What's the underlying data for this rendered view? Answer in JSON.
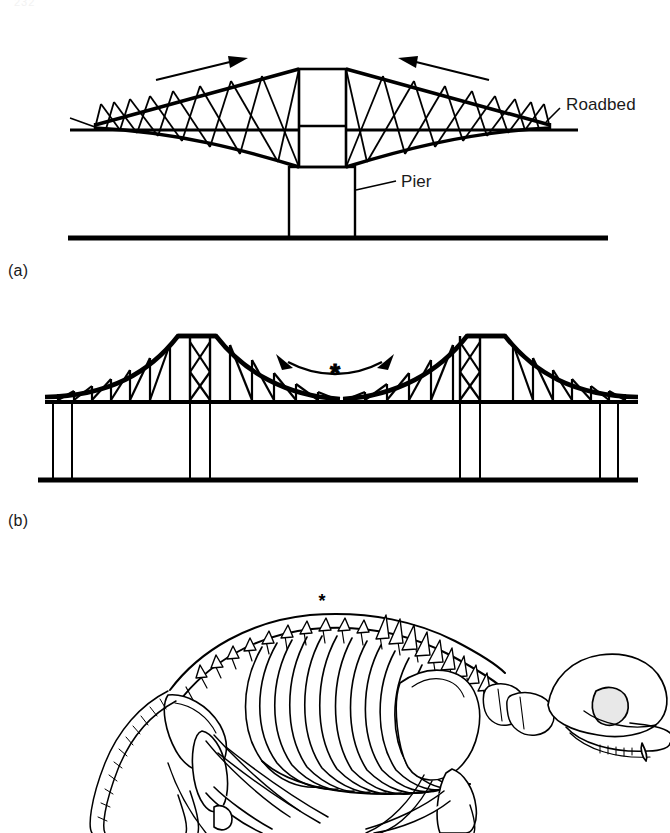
{
  "page": {
    "header_text": "232",
    "background_color": "#ffffff",
    "ink_color": "#000000"
  },
  "figure": {
    "panels": [
      {
        "id": "a",
        "caption": "(a)",
        "subject": "cantilever-bridge-single-pier",
        "labels": [
          {
            "name": "roadbed",
            "text": "Roadbed"
          },
          {
            "name": "pier",
            "text": "Pier"
          }
        ],
        "annotations": [
          {
            "name": "left-compression-arrow",
            "kind": "straight-arrow",
            "direction": "right-up"
          },
          {
            "name": "right-compression-arrow",
            "kind": "straight-arrow",
            "direction": "left-up"
          }
        ]
      },
      {
        "id": "b",
        "caption": "(b)",
        "subject": "cantilever-bridge-two-towers",
        "labels": [],
        "annotations": [
          {
            "name": "span-flex-arrow",
            "kind": "double-headed-curved-arrow",
            "direction": "bidirectional"
          },
          {
            "name": "span-asterisk",
            "kind": "asterisk",
            "text": "*"
          }
        ]
      },
      {
        "id": "c",
        "caption": "",
        "subject": "mammal-skeleton-lateral-view",
        "labels": [],
        "annotations": [
          {
            "name": "vertebral-column-asterisk",
            "kind": "asterisk",
            "text": "*"
          }
        ]
      }
    ]
  }
}
